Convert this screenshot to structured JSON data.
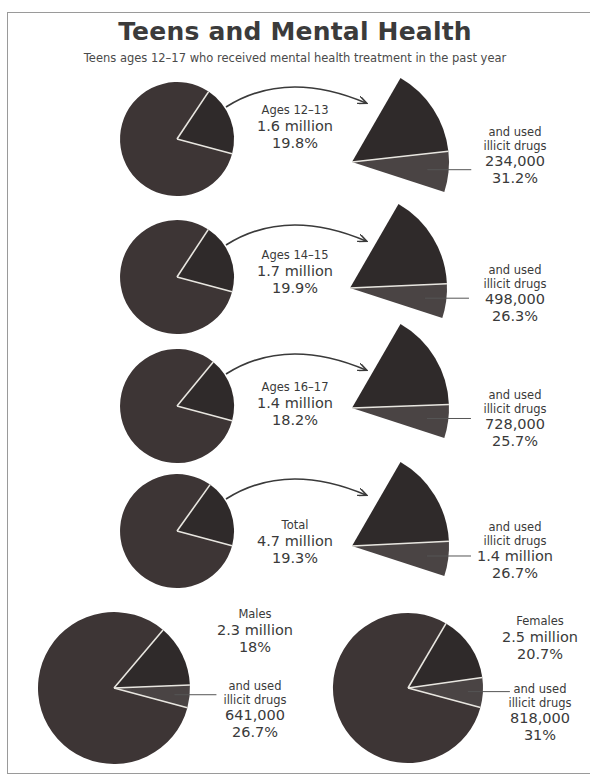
{
  "header": {
    "title": "Teens and Mental Health",
    "subtitle": "Teens ages 12–17 who received mental health treatment in the past year"
  },
  "colors": {
    "pie_main": "#3d3535",
    "pie_slice": "#2f2a2a",
    "pie_drug": "#4a4444",
    "separator": "#e8e6e0",
    "text": "#3a3a3a",
    "frame": "#9a9a9a"
  },
  "rows": [
    {
      "group_label": "Ages 12–13",
      "group_count": "1.6 million",
      "group_pct": "19.8%",
      "drug_label_1": "and used",
      "drug_label_2": "illicit drugs",
      "drug_count": "234,000",
      "drug_pct": "31.2%"
    },
    {
      "group_label": "Ages 14–15",
      "group_count": "1.7 million",
      "group_pct": "19.9%",
      "drug_label_1": "and used",
      "drug_label_2": "illicit drugs",
      "drug_count": "498,000",
      "drug_pct": "26.3%"
    },
    {
      "group_label": "Ages 16–17",
      "group_count": "1.4 million",
      "group_pct": "18.2%",
      "drug_label_1": "and used",
      "drug_label_2": "illicit drugs",
      "drug_count": "728,000",
      "drug_pct": "25.7%"
    },
    {
      "group_label": "Total",
      "group_count": "4.7 million",
      "group_pct": "19.3%",
      "drug_label_1": "and used",
      "drug_label_2": "illicit drugs",
      "drug_count": "1.4 million",
      "drug_pct": "26.7%"
    }
  ],
  "gender": [
    {
      "group_label": "Males",
      "group_count": "2.3 million",
      "group_pct": "18%",
      "drug_label_1": "and used",
      "drug_label_2": "illicit drugs",
      "drug_count": "641,000",
      "drug_pct": "26.7%"
    },
    {
      "group_label": "Females",
      "group_count": "2.5 million",
      "group_pct": "20.7%",
      "drug_label_1": "and used",
      "drug_label_2": "illicit drugs",
      "drug_count": "818,000",
      "drug_pct": "31%"
    }
  ],
  "chart_data": [
    {
      "type": "pie",
      "title": "Teens and Mental Health",
      "subtitle": "Teens ages 12–17 who received mental health treatment in the past year",
      "categories": [
        "Ages 12–13",
        "Ages 14–15",
        "Ages 16–17",
        "Total",
        "Males",
        "Females"
      ],
      "series": [
        {
          "name": "Received mental health treatment (count)",
          "values": [
            "1.6 million",
            "1.7 million",
            "1.4 million",
            "4.7 million",
            "2.3 million",
            "2.5 million"
          ]
        },
        {
          "name": "Received mental health treatment (% of group)",
          "values": [
            19.8,
            19.9,
            18.2,
            19.3,
            18,
            20.7
          ]
        },
        {
          "name": "And used illicit drugs (count)",
          "values": [
            "234,000",
            "498,000",
            "728,000",
            "1.4 million",
            "641,000",
            "818,000"
          ]
        },
        {
          "name": "And used illicit drugs (% of treated)",
          "values": [
            31.2,
            26.3,
            25.7,
            26.7,
            26.7,
            31
          ]
        }
      ]
    }
  ]
}
